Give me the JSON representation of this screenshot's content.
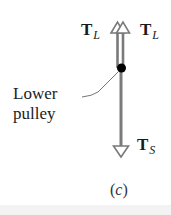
{
  "figure": {
    "caption_open": "(",
    "caption_letter": "c",
    "caption_close": ")",
    "labels": {
      "tension_left_upper": {
        "symbol": "T",
        "subscript": "L"
      },
      "tension_right_upper": {
        "symbol": "T",
        "subscript": "L"
      },
      "tension_lower": {
        "symbol": "T",
        "subscript": "S"
      },
      "pulley_line1": "Lower",
      "pulley_line2": "pulley"
    },
    "colors": {
      "rope": "#7a7a7a",
      "pulley": "#000000",
      "arrow_outline": "#7a7a7a",
      "text": "#1a1a1a"
    }
  }
}
